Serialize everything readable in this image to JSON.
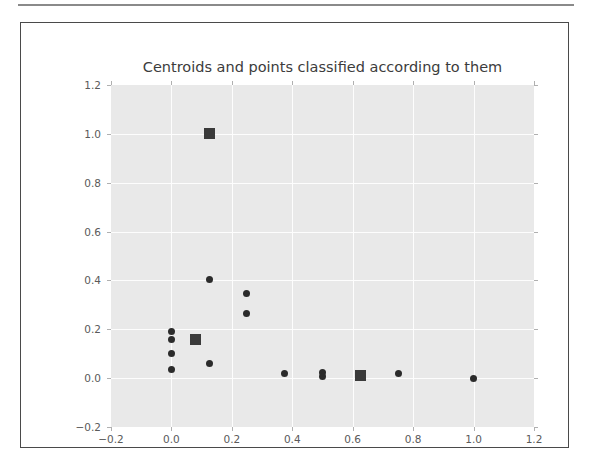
{
  "figure": {
    "background_color": "#ffffff",
    "frame_color": "#4a4a4a",
    "axes_background_color": "#e9e9e9",
    "grid_color": "#fdfdfd",
    "marker_color": "#2b2b2b",
    "centroid_color": "#3a3a3a"
  },
  "chart_data": {
    "type": "scatter",
    "title": "Centroids and points classified according to them",
    "xlabel": "",
    "ylabel": "",
    "xlim": [
      -0.2,
      1.2
    ],
    "ylim": [
      -0.2,
      1.2
    ],
    "grid": true,
    "legend": null,
    "xticks": [
      -0.2,
      0.0,
      0.2,
      0.4,
      0.6,
      0.8,
      1.0,
      1.2
    ],
    "yticks": [
      -0.2,
      0.0,
      0.2,
      0.4,
      0.6,
      0.8,
      1.0,
      1.2
    ],
    "xticklabels": [
      "-0.2",
      "0.0",
      "0.2",
      "0.4",
      "0.6",
      "0.8",
      "1.0",
      "1.2"
    ],
    "yticklabels": [
      "-0.2",
      "0.0",
      "0.2",
      "0.4",
      "0.6",
      "0.8",
      "1.0",
      "1.2"
    ],
    "series": [
      {
        "name": "points",
        "marker": "circle",
        "points": [
          {
            "x": 0.0,
            "y": 0.19
          },
          {
            "x": 0.0,
            "y": 0.16
          },
          {
            "x": 0.0,
            "y": 0.1
          },
          {
            "x": 0.0,
            "y": 0.035
          },
          {
            "x": 0.125,
            "y": 0.405
          },
          {
            "x": 0.125,
            "y": 0.06
          },
          {
            "x": 0.25,
            "y": 0.345
          },
          {
            "x": 0.25,
            "y": 0.265
          },
          {
            "x": 0.375,
            "y": 0.02
          },
          {
            "x": 0.5,
            "y": 0.025
          },
          {
            "x": 0.5,
            "y": 0.005
          },
          {
            "x": 0.75,
            "y": 0.02
          },
          {
            "x": 1.0,
            "y": 0.0
          }
        ]
      },
      {
        "name": "centroids",
        "marker": "square",
        "points": [
          {
            "x": 0.125,
            "y": 1.0
          },
          {
            "x": 0.08,
            "y": 0.16
          },
          {
            "x": 0.625,
            "y": 0.01
          }
        ]
      }
    ]
  }
}
